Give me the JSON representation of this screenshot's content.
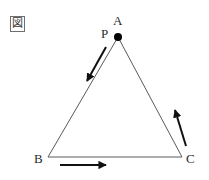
{
  "figure": {
    "tag_label": "図",
    "background_color": "#ffffff",
    "stroke_color": "#5a5a5a",
    "arrow_color": "#111111",
    "point_color": "#000000",
    "width": 209,
    "height": 180
  },
  "diagram": {
    "shape": "triangle",
    "vertices": [
      {
        "name": "A",
        "label": "A",
        "x": 118,
        "y": 37
      },
      {
        "name": "B",
        "label": "B",
        "x": 48,
        "y": 157
      },
      {
        "name": "C",
        "label": "C",
        "x": 182,
        "y": 157
      }
    ],
    "points": [
      {
        "name": "P",
        "label": "P",
        "x": 118,
        "y": 37,
        "radius": 4,
        "filled": true
      }
    ],
    "edges": [
      {
        "name": "edge-AB",
        "from": "A",
        "to": "B"
      },
      {
        "name": "edge-BC",
        "from": "B",
        "to": "C"
      },
      {
        "name": "edge-CA",
        "from": "C",
        "to": "A"
      }
    ],
    "arrows": [
      {
        "name": "arrow-ab",
        "direction": "A to B",
        "x1": 106,
        "y1": 47,
        "x2": 87,
        "y2": 81
      },
      {
        "name": "arrow-bc",
        "direction": "B to C",
        "x1": 60,
        "y1": 165,
        "x2": 106,
        "y2": 165
      },
      {
        "name": "arrow-ca",
        "direction": "C to A",
        "x1": 186,
        "y1": 146,
        "x2": 175,
        "y2": 110
      }
    ]
  }
}
